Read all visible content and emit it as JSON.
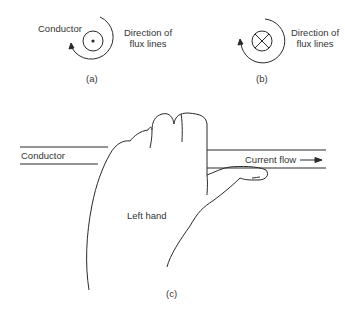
{
  "panel_a": {
    "caption": "(a)",
    "conductor_label": "Conductor",
    "flux_label_line1": "Direction of",
    "flux_label_line2": "flux lines",
    "conductor_symbol": "dot-current-out-of-page"
  },
  "panel_b": {
    "caption": "(b)",
    "flux_label_line1": "Direction of",
    "flux_label_line2": "flux lines",
    "conductor_symbol": "cross-current-into-page"
  },
  "panel_c": {
    "caption": "(c)",
    "conductor_label": "Conductor",
    "current_label": "Current flow",
    "hand_label": "Left hand"
  },
  "colors": {
    "stroke": "#2a2a2a",
    "background": "#ffffff"
  }
}
